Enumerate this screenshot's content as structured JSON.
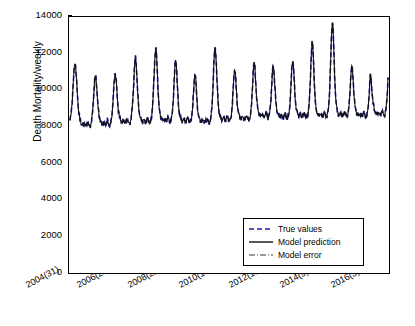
{
  "chart_data": {
    "type": "line",
    "title": "",
    "xlabel": "",
    "ylabel": "Death Mortality/weekly",
    "xlim": [
      0,
      640
    ],
    "ylim": [
      0,
      14000
    ],
    "ygrid": false,
    "xgrid": false,
    "legend_position": "lower-right-inside",
    "y_ticks": [
      0,
      2000,
      4000,
      6000,
      8000,
      10000,
      12000,
      14000
    ],
    "y_tick_labels": [
      "0",
      "2000",
      "4000",
      "6000",
      "8000",
      "10000",
      "12000",
      "14000"
    ],
    "x_ticks": [
      0,
      100,
      200,
      300,
      400,
      500,
      600
    ],
    "x_tick_labels": [
      "2004(31)",
      "2006(26)",
      "2008(22)",
      "2010(17)",
      "2012(13)",
      "2014(9)",
      "2016(3)"
    ],
    "series": [
      {
        "name": "True values",
        "style": "dashed",
        "color": "#1a1a8c",
        "values": [
          8350,
          8500,
          8700,
          9000,
          9400,
          9900,
          10400,
          10900,
          11300,
          11500,
          11350,
          11000,
          10500,
          10000,
          9500,
          9100,
          8800,
          8600,
          8400,
          8300,
          8200,
          8150,
          8100,
          8100,
          8150,
          8200,
          8150,
          8100,
          8050,
          8050,
          8100,
          8200,
          8300,
          8200,
          8100,
          8050,
          8000,
          8050,
          8150,
          8300,
          8500,
          8800,
          9200,
          9700,
          10200,
          10600,
          10800,
          10700,
          10400,
          10000,
          9500,
          9100,
          8800,
          8600,
          8450,
          8350,
          8250,
          8200,
          8150,
          8150,
          8200,
          8250,
          8200,
          8150,
          8100,
          8100,
          8150,
          8250,
          8350,
          8250,
          8150,
          8100,
          8050,
          8100,
          8200,
          8350,
          8600,
          8900,
          9300,
          9800,
          10300,
          10700,
          10900,
          10800,
          10500,
          10100,
          9600,
          9200,
          8900,
          8700,
          8550,
          8450,
          8350,
          8300,
          8250,
          8250,
          8300,
          8350,
          8300,
          8250,
          8200,
          8200,
          8250,
          8350,
          8450,
          8350,
          8250,
          8200,
          8150,
          8200,
          8300,
          8450,
          8700,
          9000,
          9400,
          9900,
          10500,
          11100,
          11600,
          11800,
          11600,
          11100,
          10500,
          9900,
          9400,
          9000,
          8750,
          8600,
          8500,
          8400,
          8350,
          8300,
          8300,
          8350,
          8400,
          8350,
          8300,
          8250,
          8250,
          8300,
          8400,
          8500,
          8400,
          8300,
          8250,
          8200,
          8250,
          8350,
          8500,
          8750,
          9100,
          9600,
          10200,
          10900,
          11600,
          12100,
          12300,
          12050,
          11500,
          10800,
          10100,
          9500,
          9050,
          8800,
          8650,
          8550,
          8450,
          8400,
          8350,
          8350,
          8400,
          8450,
          8400,
          8350,
          8300,
          8300,
          8350,
          8450,
          8550,
          8450,
          8350,
          8300,
          8250,
          8300,
          8400,
          8550,
          8800,
          9150,
          9650,
          10250,
          10900,
          11400,
          11650,
          11500,
          11000,
          10350,
          9750,
          9250,
          8900,
          8700,
          8570,
          8480,
          8400,
          8350,
          8320,
          8320,
          8370,
          8420,
          8370,
          8320,
          8280,
          8280,
          8330,
          8430,
          8530,
          8430,
          8330,
          8280,
          8230,
          8280,
          8380,
          8530,
          8780,
          9100,
          9550,
          10100,
          10600,
          10900,
          10800,
          10400,
          9850,
          9350,
          8950,
          8700,
          8550,
          8450,
          8380,
          8330,
          8300,
          8280,
          8280,
          8330,
          8380,
          8330,
          8280,
          8250,
          8250,
          8300,
          8400,
          8500,
          8400,
          8300,
          8250,
          8200,
          8250,
          8350,
          8500,
          8750,
          9100,
          9600,
          10300,
          11100,
          11800,
          12200,
          12300,
          12000,
          11400,
          10700,
          10000,
          9450,
          9050,
          8800,
          8650,
          8550,
          8480,
          8430,
          8400,
          8400,
          8450,
          8500,
          8450,
          8400,
          8350,
          8350,
          8400,
          8500,
          8600,
          8500,
          8400,
          8350,
          8300,
          8350,
          8450,
          8600,
          8850,
          9200,
          9700,
          10300,
          10800,
          11100,
          11050,
          10700,
          10200,
          9700,
          9300,
          9000,
          8800,
          8680,
          8600,
          8530,
          8480,
          8450,
          8450,
          8500,
          8550,
          8500,
          8450,
          8400,
          8400,
          8450,
          8550,
          8650,
          8550,
          8450,
          8400,
          8350,
          8400,
          8500,
          8650,
          8900,
          9250,
          9750,
          10400,
          11000,
          11400,
          11500,
          11250,
          10750,
          10200,
          9700,
          9300,
          9050,
          8880,
          8780,
          8700,
          8650,
          8600,
          8600,
          8650,
          8700,
          8650,
          8600,
          8550,
          8550,
          8600,
          8700,
          8800,
          8700,
          8600,
          8550,
          8500,
          8550,
          8650,
          8800,
          9050,
          9400,
          9900,
          10500,
          11000,
          11300,
          11250,
          10900,
          10400,
          9900,
          9450,
          9100,
          8900,
          8780,
          8700,
          8630,
          8580,
          8550,
          8550,
          8600,
          8650,
          8600,
          8550,
          8500,
          8500,
          8550,
          8650,
          8750,
          8650,
          8550,
          8500,
          8450,
          8500,
          8600,
          8750,
          9000,
          9350,
          9850,
          10500,
          11100,
          11500,
          11600,
          11350,
          10850,
          10250,
          9700,
          9300,
          9050,
          8880,
          8780,
          8700,
          8650,
          8600,
          8600,
          8650,
          8700,
          8650,
          8600,
          8550,
          8550,
          8600,
          8700,
          8800,
          8700,
          8600,
          8550,
          8500,
          8550,
          8650,
          8800,
          9050,
          9400,
          9950,
          10700,
          11500,
          12200,
          12600,
          12500,
          12000,
          11300,
          10500,
          9850,
          9350,
          9050,
          8880,
          8780,
          8700,
          8650,
          8620,
          8620,
          8670,
          8720,
          8670,
          8620,
          8580,
          8580,
          8630,
          8730,
          8830,
          8730,
          8630,
          8580,
          8530,
          8580,
          8680,
          8830,
          9100,
          9500,
          10100,
          10900,
          11800,
          12700,
          13400,
          13750,
          13500,
          12700,
          11700,
          10800,
          10100,
          9600,
          9250,
          9000,
          8850,
          8750,
          8680,
          8650,
          8650,
          8700,
          8750,
          8700,
          8650,
          8600,
          8600,
          8650,
          8750,
          8850,
          8750,
          8650,
          8600,
          8550,
          8600,
          8700,
          8850,
          9100,
          9450,
          9950,
          10550,
          11050,
          11300,
          11200,
          10850,
          10350,
          9850,
          9450,
          9150,
          8950,
          8830,
          8750,
          8700,
          8650,
          8620,
          8620,
          8670,
          8720,
          8670,
          8620,
          8580,
          8580,
          8630,
          8730,
          8830,
          8730,
          8630,
          8580,
          8530,
          8580,
          8680,
          8830,
          9100,
          9450,
          9950,
          10500,
          10900,
          10700,
          10300,
          9900,
          9550,
          9300,
          9100,
          8950,
          8850,
          8780,
          8720,
          8700,
          8700,
          8750,
          8800,
          8750,
          8700,
          8650,
          8650,
          8700,
          8800,
          8900,
          8800,
          8700,
          8650,
          8600,
          8650,
          8750,
          8900,
          9150,
          9500,
          10000,
          10650
        ]
      },
      {
        "name": "Model prediction",
        "style": "solid",
        "color": "#111111"
      },
      {
        "name": "Model error",
        "style": "dash-dot",
        "color": "#6e6e6e"
      }
    ]
  },
  "axes": {
    "ylabel": "Death Mortality/weekly"
  },
  "legend": {
    "entries": [
      {
        "label": "True values",
        "style": "dashed",
        "color": "#2222aa"
      },
      {
        "label": "Model prediction",
        "style": "solid",
        "color": "#111111"
      },
      {
        "label": "Model error",
        "style": "dash-dot",
        "color": "#7a7a7a"
      }
    ]
  }
}
